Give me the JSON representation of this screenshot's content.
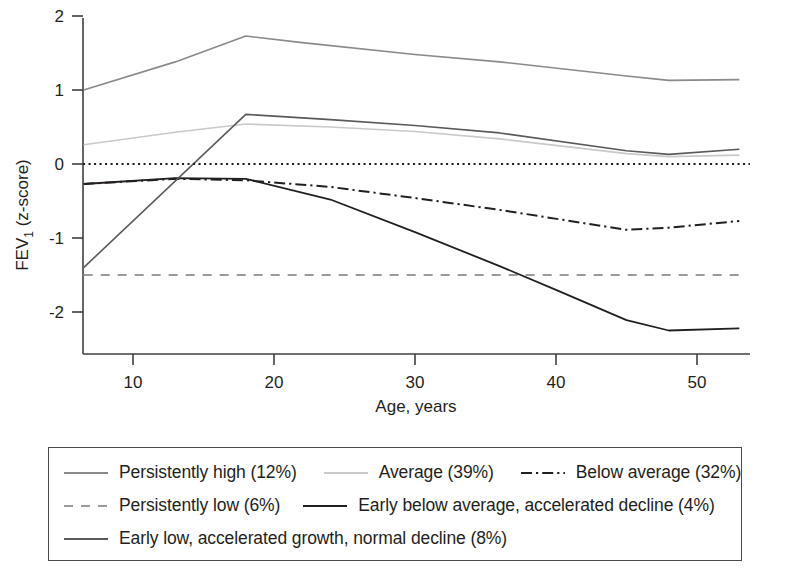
{
  "chart_data": {
    "type": "line",
    "title": "",
    "xlabel": "Age, years",
    "ylabel": "FEV1 (z-score)",
    "ylabel_main": "FEV",
    "ylabel_sub": "1",
    "ylabel_tail": " (z-score)",
    "xlim": [
      6.5,
      53
    ],
    "ylim": [
      -2.55,
      2.25
    ],
    "xticks": [
      10,
      20,
      30,
      40,
      50
    ],
    "yticks": [
      2,
      1,
      0,
      -1,
      -2
    ],
    "grid": false,
    "legend_position": "below",
    "reference_line": {
      "y": 0,
      "style": "dotted",
      "color": "#231f20"
    },
    "series": [
      {
        "name": "Persistently high (12%)",
        "key": "persistently-high",
        "style": "solid",
        "color": "#8a8a8a",
        "width": 1.6,
        "points": [
          [
            6.5,
            1.0
          ],
          [
            13,
            1.38
          ],
          [
            18,
            1.73
          ],
          [
            22,
            1.64
          ],
          [
            30,
            1.48
          ],
          [
            36,
            1.38
          ],
          [
            45,
            1.19
          ],
          [
            48,
            1.13
          ],
          [
            53,
            1.14
          ]
        ]
      },
      {
        "name": "Average (39%)",
        "key": "average",
        "style": "solid",
        "color": "#c9c9c9",
        "width": 1.6,
        "points": [
          [
            6.5,
            0.26
          ],
          [
            13,
            0.43
          ],
          [
            18,
            0.54
          ],
          [
            24,
            0.5
          ],
          [
            30,
            0.44
          ],
          [
            36,
            0.34
          ],
          [
            45,
            0.14
          ],
          [
            48,
            0.1
          ],
          [
            53,
            0.12
          ]
        ]
      },
      {
        "name": "Below average (32%)",
        "key": "below-average",
        "style": "dash-dot",
        "color": "#231f20",
        "width": 2.0,
        "points": [
          [
            6.5,
            -0.27
          ],
          [
            13,
            -0.2
          ],
          [
            18,
            -0.22
          ],
          [
            24,
            -0.31
          ],
          [
            30,
            -0.46
          ],
          [
            36,
            -0.62
          ],
          [
            45,
            -0.89
          ],
          [
            48,
            -0.86
          ],
          [
            53,
            -0.77
          ]
        ]
      },
      {
        "name": "Persistently low (6%)",
        "key": "persistently-low",
        "style": "dashed",
        "color": "#9b9b9b",
        "width": 1.8,
        "points": [
          [
            6.5,
            -1.5
          ],
          [
            53,
            -1.5
          ]
        ]
      },
      {
        "name": "Early below average, accelerated decline (4%)",
        "key": "early-below-average-accelerated-decline",
        "style": "solid",
        "color": "#231f20",
        "width": 1.8,
        "points": [
          [
            6.5,
            -0.27
          ],
          [
            13,
            -0.19
          ],
          [
            18,
            -0.2
          ],
          [
            24,
            -0.48
          ],
          [
            30,
            -0.92
          ],
          [
            36,
            -1.38
          ],
          [
            40,
            -1.7
          ],
          [
            45,
            -2.11
          ],
          [
            48,
            -2.25
          ],
          [
            53,
            -2.22
          ]
        ]
      },
      {
        "name": "Early low, accelerated growth, normal decline (8%)",
        "key": "early-low-accelerated-growth-normal-decline",
        "style": "solid",
        "color": "#5a5a5a",
        "width": 1.6,
        "points": [
          [
            6.5,
            -1.4
          ],
          [
            18,
            0.67
          ],
          [
            24,
            0.6
          ],
          [
            30,
            0.52
          ],
          [
            36,
            0.42
          ],
          [
            45,
            0.18
          ],
          [
            48,
            0.13
          ],
          [
            53,
            0.2
          ]
        ]
      }
    ]
  },
  "axis": {
    "xlabel": "Age, years",
    "ylabel_main": "FEV",
    "ylabel_sub": "1",
    "ylabel_tail": " (z-score)",
    "xtick_labels": [
      "10",
      "20",
      "30",
      "40",
      "50"
    ],
    "ytick_labels": [
      "2",
      "1",
      "0",
      "-1",
      "-2"
    ]
  },
  "legend": {
    "rows": [
      [
        {
          "label": "Persistently high (12%)",
          "key": "persistently-high"
        },
        {
          "label": "Average (39%)",
          "key": "average"
        },
        {
          "label": "Below average (32%)",
          "key": "below-average"
        }
      ],
      [
        {
          "label": "Persistently low (6%)",
          "key": "persistently-low"
        },
        {
          "label": "Early below average, accelerated decline (4%)",
          "key": "early-below-average-accelerated-decline"
        }
      ],
      [
        {
          "label": "Early low, accelerated growth, normal decline (8%)",
          "key": "early-low-accelerated-growth-normal-decline"
        }
      ]
    ]
  }
}
